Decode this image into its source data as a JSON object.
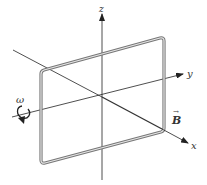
{
  "diagram": {
    "axes": {
      "x_label": "x",
      "y_label": "y",
      "z_label": "z"
    },
    "field_label": "B",
    "field_vector_arrow": "→",
    "angular_velocity_label": "ω",
    "colors": {
      "axis": "#222222",
      "loop_outer": "#777777",
      "loop_inner": "#e6e6e6",
      "background": "#ffffff"
    }
  }
}
